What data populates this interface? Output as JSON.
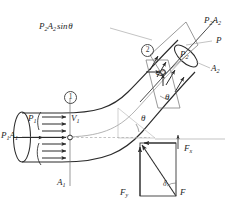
{
  "figure": {
    "background_color": "#ffffff",
    "line_color": "#2b2b2b",
    "light_line_color": "#9a9a9a",
    "text_color": "#262626"
  },
  "labels": {
    "inlet_pressure_force": {
      "main": "P",
      "sub": "1",
      "main2": "A",
      "sub2": "1",
      "text": "P1A1"
    },
    "inlet_pressure": {
      "main": "P",
      "sub": "1",
      "text": "P1"
    },
    "inlet_velocity": {
      "main": "V",
      "sub": "1",
      "text": "V1"
    },
    "inlet_area": {
      "main": "A",
      "sub": "1",
      "text": "A1"
    },
    "outlet_pressure_force": {
      "main": "P",
      "sub": "2",
      "main2": "A",
      "sub2": "2",
      "text": "P2A2"
    },
    "outlet_pressure": {
      "main": "P",
      "sub": "2",
      "text": "P2"
    },
    "outlet_velocity": {
      "main": "V",
      "sub": "2",
      "text": "V2"
    },
    "outlet_area": {
      "main": "A",
      "sub": "2",
      "text": "A2"
    },
    "pressure_generic": {
      "text": "P"
    },
    "vertical_component": {
      "text": "P2A2 sin 0",
      "prefix": "P",
      "sub": "2",
      "mid": "A",
      "sub2": "2",
      "suffix": "sin",
      "angle": "θ"
    },
    "angle_theta_centerline": {
      "text": "θ"
    },
    "angle_theta_outlet": {
      "text": "θ"
    },
    "angle_delta": {
      "text": "δ"
    },
    "force_x": {
      "main": "F",
      "sub": "x",
      "text": "Fx"
    },
    "force_y": {
      "main": "F",
      "sub": "y",
      "text": "Fy"
    },
    "force_resultant": {
      "text": "F"
    },
    "section_one": {
      "text": "①",
      "number": "1"
    },
    "section_two": {
      "text": "②",
      "number": "2"
    }
  },
  "annotations": {
    "section_markers": [
      "1",
      "2"
    ],
    "angles": [
      "θ",
      "θ",
      "δ"
    ],
    "forces": [
      "P1A1",
      "P2A2",
      "Fx",
      "Fy",
      "F"
    ],
    "velocities": [
      "V1",
      "V2"
    ]
  }
}
